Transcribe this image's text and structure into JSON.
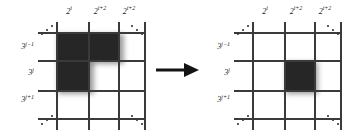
{
  "figure": {
    "arrow": {
      "name": "transformation-arrow",
      "direction": "right"
    },
    "colors": {
      "shaded_cell": "#262626",
      "grid_line": "#3a3a3a",
      "background": "#ffffff",
      "text": "#1a1a1a"
    },
    "panels": [
      {
        "id": "left",
        "name": "before-grid",
        "x_labels": [
          {
            "base": "2",
            "exp": "i"
          },
          {
            "base": "2",
            "exp": "i+2"
          },
          {
            "base": "2",
            "exp": "i+2"
          }
        ],
        "y_labels": [
          {
            "base": "3",
            "exp": "j−1"
          },
          {
            "base": "3",
            "exp": "j"
          },
          {
            "base": "3",
            "exp": "j+1"
          }
        ],
        "grid": {
          "vertical_lines": 4,
          "horizontal_lines": 4
        },
        "shaded_cells": [
          {
            "col": 0,
            "row": 0
          },
          {
            "col": 1,
            "row": 0
          },
          {
            "col": 2,
            "row": 0
          },
          {
            "col": 0,
            "row": 1
          },
          {
            "col": 1,
            "row": 1
          }
        ],
        "corner_dots": [
          "top-left",
          "top-right",
          "bottom-left",
          "bottom-right"
        ]
      },
      {
        "id": "right",
        "name": "after-grid",
        "x_labels": [
          {
            "base": "2",
            "exp": "i"
          },
          {
            "base": "2",
            "exp": "i+2"
          },
          {
            "base": "2",
            "exp": "i+2"
          }
        ],
        "y_labels": [
          {
            "base": "3",
            "exp": "j−1"
          },
          {
            "base": "3",
            "exp": "j"
          },
          {
            "base": "3",
            "exp": "j+1"
          }
        ],
        "grid": {
          "vertical_lines": 4,
          "horizontal_lines": 4
        },
        "shaded_cells": [
          {
            "col": 1,
            "row": 1
          }
        ],
        "corner_dots": [
          "top-left",
          "top-right",
          "bottom-left",
          "bottom-right"
        ]
      }
    ]
  }
}
